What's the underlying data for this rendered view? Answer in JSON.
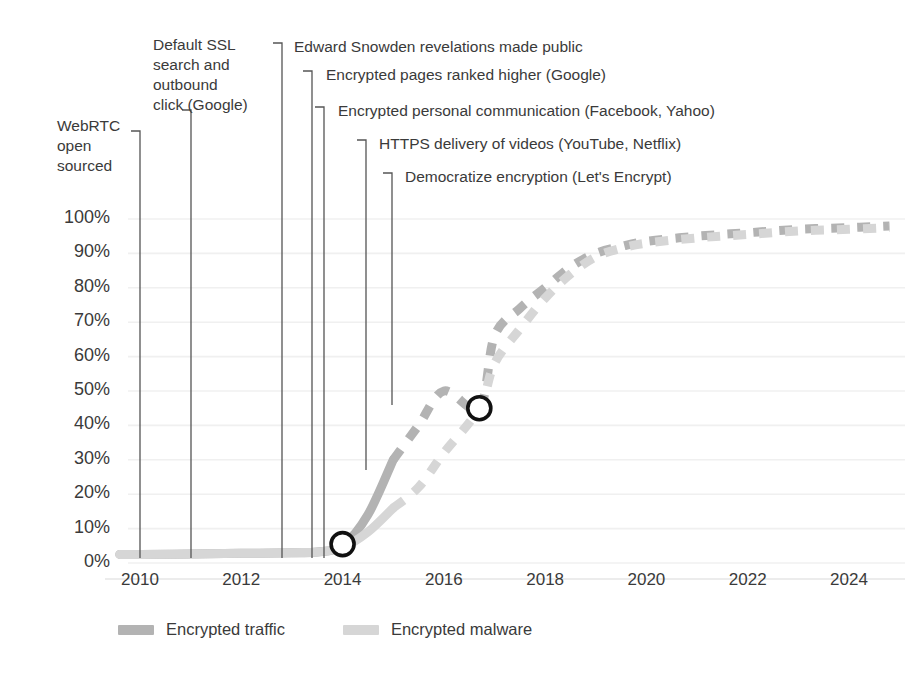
{
  "chart_data": {
    "type": "line",
    "title": "",
    "xlabel": "",
    "ylabel": "",
    "xlim": [
      2009.3,
      2025.1
    ],
    "ylim": [
      0,
      105
    ],
    "grid": true,
    "legend_position": "bottom-left",
    "xticks": [
      "2010",
      "2012",
      "2014",
      "2016",
      "2018",
      "2020",
      "2022",
      "2024"
    ],
    "xtick_values": [
      2010,
      2012,
      2014,
      2016,
      2018,
      2020,
      2022,
      2024
    ],
    "yticks": [
      "0%",
      "10%",
      "20%",
      "30%",
      "40%",
      "50%",
      "60%",
      "70%",
      "80%",
      "90%",
      "100%"
    ],
    "ytick_values": [
      0,
      10,
      20,
      30,
      40,
      50,
      60,
      70,
      80,
      90,
      100
    ],
    "series": [
      {
        "name": "Encrypted traffic",
        "color": "#b3b3b3",
        "solid_through": 2015.0,
        "x": [
          2009.6,
          2010,
          2011,
          2012,
          2013,
          2013.5,
          2014,
          2014.5,
          2015,
          2015.5,
          2016,
          2016.7,
          2017,
          2017.5,
          2018,
          2018.5,
          2019,
          2019.5,
          2020,
          2021,
          2022,
          2023,
          2024,
          2024.8
        ],
        "values": [
          2.5,
          2.5,
          2.6,
          2.8,
          3.0,
          3.2,
          5.0,
          14,
          30,
          40,
          50,
          45,
          66,
          74,
          80,
          86,
          90,
          92,
          93.5,
          95,
          96,
          97,
          97.5,
          98
        ]
      },
      {
        "name": "Encrypted malware",
        "color": "#d6d6d6",
        "solid_through": 2015.0,
        "x": [
          2009.6,
          2010,
          2011,
          2012,
          2013,
          2013.5,
          2014,
          2014.5,
          2015,
          2015.5,
          2016,
          2016.7,
          2017,
          2017.5,
          2018,
          2018.5,
          2019,
          2019.5,
          2020,
          2021,
          2022,
          2023,
          2024,
          2024.8
        ],
        "values": [
          2.5,
          2.5,
          2.6,
          2.8,
          3.0,
          3.2,
          4.5,
          9,
          16,
          22,
          32,
          45,
          58,
          68,
          77,
          84,
          89,
          91.5,
          93,
          94.5,
          95.5,
          96.5,
          97,
          97.5
        ]
      }
    ],
    "markers": [
      {
        "x": 2014.0,
        "y": 5.5,
        "series": "Encrypted traffic",
        "style": "open-circle"
      },
      {
        "x": 2016.7,
        "y": 45.0,
        "series": "Encrypted traffic",
        "style": "open-circle"
      }
    ],
    "annotations": [
      {
        "text": "WebRTC\nopen\nsourced",
        "label_x": 57,
        "label_y": 116,
        "leader_x": 140,
        "leader_top": 131,
        "leader_bottom": 558,
        "align": "left"
      },
      {
        "text": "Default SSL\nsearch and\noutbound\nclick (Google)",
        "label_x": 153,
        "label_y": 35,
        "leader_x": 191,
        "leader_top": 110,
        "leader_bottom": 558,
        "align": "left"
      },
      {
        "text": "Edward Snowden revelations made public",
        "label_x": 294,
        "label_y": 37,
        "leader_x": 282,
        "leader_top": 43,
        "leader_bottom": 558,
        "align": "left"
      },
      {
        "text": "Encrypted pages ranked higher (Google)",
        "label_x": 326,
        "label_y": 65,
        "leader_x": 312,
        "leader_top": 71,
        "leader_bottom": 558,
        "align": "left"
      },
      {
        "text": "Encrypted personal communication (Facebook, Yahoo)",
        "label_x": 338,
        "label_y": 101,
        "leader_x": 324,
        "leader_top": 107,
        "leader_bottom": 558,
        "align": "left"
      },
      {
        "text": "HTTPS delivery of videos (YouTube, Netflix)",
        "label_x": 379,
        "label_y": 134,
        "leader_x": 366,
        "leader_top": 140,
        "leader_bottom": 470,
        "align": "left"
      },
      {
        "text": "Democratize encryption (Let's Encrypt)",
        "label_x": 405,
        "label_y": 167,
        "leader_x": 392,
        "leader_top": 173,
        "leader_bottom": 405,
        "align": "left"
      }
    ]
  },
  "legend": {
    "items": [
      {
        "label": "Encrypted traffic",
        "color": "#b3b3b3"
      },
      {
        "label": "Encrypted malware",
        "color": "#d6d6d6"
      }
    ]
  },
  "colors": {
    "background": "#ffffff",
    "gridline": "#f0f0f0",
    "text": "#3a3a3a",
    "leader_line": "#555555",
    "marker_stroke": "#111111"
  }
}
